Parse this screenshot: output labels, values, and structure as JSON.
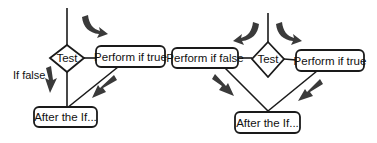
{
  "left_diagram": {
    "decision": "Test",
    "true_branch": "Perform if true",
    "false_label": "If false",
    "merge": "After the If..."
  },
  "right_diagram": {
    "decision": "Test",
    "false_branch": "Perform if false",
    "true_branch": "Perform if true",
    "merge": "After the If..."
  },
  "colors": {
    "line": "#1a1a1a",
    "arrow": "#3a3a3a",
    "background": "#ffffff"
  }
}
